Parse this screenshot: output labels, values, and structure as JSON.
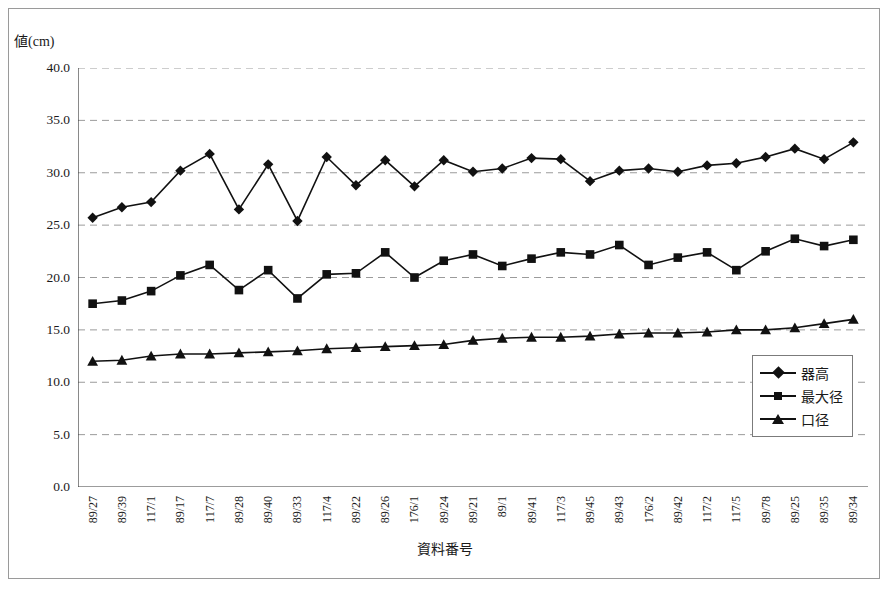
{
  "chart_data": {
    "type": "line",
    "title": "",
    "xlabel": "資料番号",
    "ylabel": "値(cm)",
    "ylim": [
      0,
      40
    ],
    "ytick_step": 5,
    "ytick_labels": [
      "40.0",
      "35.0",
      "30.0",
      "25.0",
      "20.0",
      "15.0",
      "10.0",
      "5.0",
      "0.0"
    ],
    "grid": true,
    "grid_axis": "y",
    "grid_style": "dashed",
    "legend_position": "bottom-right",
    "categories": [
      "89/27",
      "89/39",
      "117/1",
      "89/17",
      "117/7",
      "89/28",
      "89/40",
      "89/33",
      "117/4",
      "89/22",
      "89/26",
      "176/1",
      "89/24",
      "89/21",
      "89/1",
      "89/41",
      "117/3",
      "89/45",
      "89/43",
      "176/2",
      "89/42",
      "117/2",
      "117/5",
      "89/78",
      "89/25",
      "89/35",
      "89/34"
    ],
    "series": [
      {
        "name": "器高",
        "marker": "diamond",
        "color": "#111111",
        "values": [
          25.7,
          26.7,
          27.2,
          30.2,
          31.8,
          26.5,
          30.8,
          25.4,
          31.5,
          28.8,
          31.2,
          28.7,
          31.2,
          30.1,
          30.4,
          31.4,
          31.3,
          29.2,
          30.2,
          30.4,
          30.1,
          30.7,
          30.9,
          31.5,
          32.3,
          31.3,
          32.9
        ]
      },
      {
        "name": "最大径",
        "marker": "square",
        "color": "#111111",
        "values": [
          17.5,
          17.8,
          18.7,
          20.2,
          21.2,
          18.8,
          20.7,
          18.0,
          20.3,
          20.4,
          22.4,
          20.0,
          21.6,
          22.2,
          21.1,
          21.8,
          22.4,
          22.2,
          23.1,
          21.2,
          21.9,
          22.4,
          20.7,
          22.5,
          23.7,
          23.0,
          23.6
        ]
      },
      {
        "name": "口径",
        "marker": "triangle",
        "color": "#111111",
        "values": [
          12.0,
          12.1,
          12.5,
          12.7,
          12.7,
          12.8,
          12.9,
          13.0,
          13.2,
          13.3,
          13.4,
          13.5,
          13.6,
          14.0,
          14.2,
          14.3,
          14.3,
          14.4,
          14.6,
          14.7,
          14.7,
          14.8,
          15.0,
          15.0,
          15.2,
          15.6,
          16.0
        ]
      }
    ]
  }
}
